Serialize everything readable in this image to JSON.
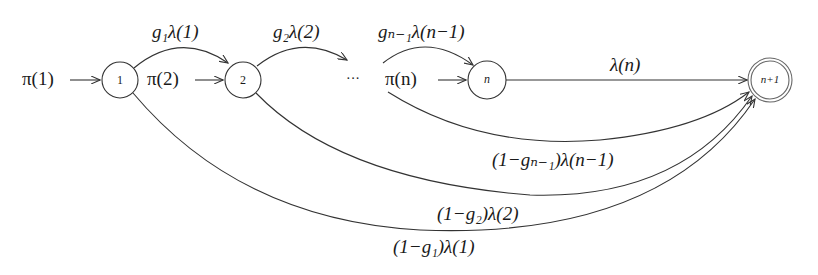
{
  "diagram": {
    "type": "state-transition",
    "nodes": [
      {
        "id": "1",
        "label": "1",
        "cx": 120,
        "cy": 80,
        "r": 18,
        "style": "single"
      },
      {
        "id": "2",
        "label": "2",
        "cx": 243,
        "cy": 80,
        "r": 18,
        "style": "single"
      },
      {
        "id": "dots",
        "label": "···",
        "cx": 353,
        "cy": 80
      },
      {
        "id": "n",
        "label": "n",
        "cx": 487,
        "cy": 80,
        "r": 19,
        "style": "single"
      },
      {
        "id": "n+1",
        "label": "n+1",
        "cx": 770,
        "cy": 80,
        "r": 21,
        "style": "double"
      }
    ],
    "entry_labels": [
      {
        "id": "pi1",
        "text": "π(1)",
        "target": "1"
      },
      {
        "id": "pi2",
        "text": "π(2)",
        "target": "2"
      },
      {
        "id": "pin",
        "text": "π(n)",
        "target": "n"
      }
    ],
    "edges": [
      {
        "from": "1",
        "to": "2",
        "label": "g₁λ(1)",
        "position": "top"
      },
      {
        "from": "2",
        "to": "dots",
        "label": "g₂λ(2)",
        "position": "top"
      },
      {
        "from": "dots",
        "to": "n",
        "label": "gₙ₋₁λ(n−1)",
        "position": "top"
      },
      {
        "from": "n",
        "to": "n+1",
        "label": "λ(n)",
        "position": "top"
      },
      {
        "from": "dots",
        "to": "n+1",
        "label": "(1−gₙ₋₁)λ(n−1)",
        "position": "bottom"
      },
      {
        "from": "2",
        "to": "n+1",
        "label": "(1−g₂)λ(2)",
        "position": "bottom"
      },
      {
        "from": "1",
        "to": "n+1",
        "label": "(1−g₁)λ(1)",
        "position": "bottom"
      }
    ],
    "colors": {
      "stroke": "#333333",
      "text": "#1a1a1a",
      "background": "#ffffff"
    }
  }
}
